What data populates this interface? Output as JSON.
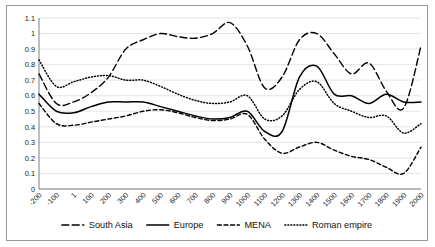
{
  "chart_data": {
    "type": "line",
    "title": "",
    "subtitle": "",
    "xlabel": "",
    "ylabel": "",
    "xlim": [
      -200,
      2000
    ],
    "ylim": [
      0,
      1.1
    ],
    "grid": true,
    "legend_position": "bottom",
    "y_ticks": [
      "0",
      "0.1",
      "0.2",
      "0.3",
      "0.4",
      "0.5",
      "0.6",
      "0.7",
      "0.8",
      "0.9",
      "1",
      "1.1"
    ],
    "y_tick_values": [
      0,
      0.1,
      0.2,
      0.3,
      0.4,
      0.5,
      0.6,
      0.7,
      0.8,
      0.9,
      1.0,
      1.1
    ],
    "x_ticks": [
      "-200",
      "-100",
      "1",
      "100",
      "200",
      "300",
      "400",
      "500",
      "600",
      "700",
      "800",
      "900",
      "1000",
      "1100",
      "1200",
      "1300",
      "1400",
      "1500",
      "1600",
      "1700",
      "1800",
      "1900",
      "2000"
    ],
    "x_tick_values": [
      -200,
      -100,
      1,
      100,
      200,
      300,
      400,
      500,
      600,
      700,
      800,
      900,
      1000,
      1100,
      1200,
      1300,
      1400,
      1500,
      1600,
      1700,
      1800,
      1900,
      2000
    ],
    "x": [
      -200,
      -100,
      1,
      100,
      200,
      300,
      400,
      500,
      600,
      700,
      800,
      900,
      1000,
      1100,
      1200,
      1300,
      1400,
      1500,
      1600,
      1700,
      1800,
      1900,
      2000
    ],
    "series": [
      {
        "name": "South Asia",
        "style": "long-dash",
        "color": "#000000",
        "values": [
          0.74,
          0.55,
          0.56,
          0.62,
          0.72,
          0.9,
          0.96,
          1.0,
          0.98,
          0.97,
          1.0,
          1.07,
          0.92,
          0.65,
          0.72,
          0.96,
          1.0,
          0.87,
          0.74,
          0.81,
          0.63,
          0.52,
          0.92
        ]
      },
      {
        "name": "Europe",
        "style": "solid",
        "color": "#000000",
        "values": [
          0.61,
          0.5,
          0.49,
          0.53,
          0.56,
          0.56,
          0.56,
          0.53,
          0.5,
          0.47,
          0.45,
          0.46,
          0.5,
          0.37,
          0.37,
          0.72,
          0.79,
          0.61,
          0.6,
          0.55,
          0.61,
          0.56,
          0.56
        ]
      },
      {
        "name": "MENA",
        "style": "short-dash",
        "color": "#000000",
        "values": [
          0.55,
          0.42,
          0.41,
          0.43,
          0.45,
          0.47,
          0.5,
          0.51,
          0.49,
          0.46,
          0.44,
          0.45,
          0.48,
          0.32,
          0.23,
          0.27,
          0.3,
          0.25,
          0.21,
          0.19,
          0.14,
          0.1,
          0.27
        ]
      },
      {
        "name": "Roman empire",
        "style": "dotted",
        "color": "#000000",
        "values": [
          0.83,
          0.66,
          0.69,
          0.72,
          0.73,
          0.7,
          0.7,
          0.66,
          0.61,
          0.57,
          0.55,
          0.56,
          0.6,
          0.45,
          0.47,
          0.64,
          0.69,
          0.55,
          0.5,
          0.46,
          0.47,
          0.36,
          0.42
        ]
      }
    ]
  },
  "legend": {
    "items": [
      {
        "label": "South Asia",
        "style": "long-dash"
      },
      {
        "label": "Europe",
        "style": "solid"
      },
      {
        "label": "MENA",
        "style": "short-dash"
      },
      {
        "label": "Roman empire",
        "style": "dotted"
      }
    ]
  }
}
